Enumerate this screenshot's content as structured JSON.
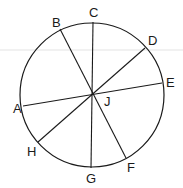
{
  "diagram": {
    "circle": {
      "cx": 92,
      "cy": 95,
      "r": 72,
      "stroke": "#1a1a1a"
    },
    "center_point": {
      "label": "J",
      "x": 92,
      "y": 94
    },
    "guide_line": {
      "y": 50,
      "color": "#d0d0d0"
    },
    "points": {
      "A": {
        "x": 23,
        "y": 106,
        "label": "A",
        "lx": 13,
        "ly": 113
      },
      "B": {
        "x": 60,
        "y": 29,
        "label": "B",
        "lx": 52,
        "ly": 27
      },
      "C": {
        "x": 93,
        "y": 22,
        "label": "C",
        "lx": 89,
        "ly": 17
      },
      "D": {
        "x": 145,
        "y": 48,
        "label": "D",
        "lx": 148,
        "ly": 45
      },
      "E": {
        "x": 162,
        "y": 83,
        "label": "E",
        "lx": 166,
        "ly": 87
      },
      "F": {
        "x": 126,
        "y": 158,
        "label": "F",
        "lx": 127,
        "ly": 172
      },
      "G": {
        "x": 91,
        "y": 168,
        "label": "G",
        "lx": 86,
        "ly": 183
      },
      "H": {
        "x": 38,
        "y": 142,
        "label": "H",
        "lx": 27,
        "ly": 156
      },
      "J": {
        "label": "J",
        "lx": 104,
        "ly": 106
      }
    },
    "segments": [
      {
        "from": "A",
        "to": "E",
        "name": "segment-AE"
      },
      {
        "from": "B",
        "to": "F",
        "name": "segment-BF"
      },
      {
        "from": "C",
        "to": "G",
        "name": "segment-CG"
      },
      {
        "from": "D",
        "to": "H",
        "name": "segment-DH"
      }
    ]
  }
}
